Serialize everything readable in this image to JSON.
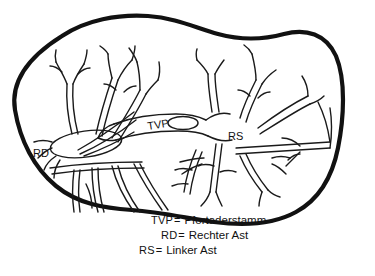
{
  "figure": {
    "type": "anatomical-diagram",
    "background_color": "#ffffff",
    "outline_color": "#111111",
    "vessel_color": "#1a1a1a"
  },
  "labels": {
    "trunk": "TVP",
    "right_branch": "RD",
    "left_branch": "RS"
  },
  "legend": {
    "rows": [
      {
        "abbr": "TVP",
        "eq": "=",
        "term": "Pfortaderstamm"
      },
      {
        "abbr": "RD",
        "eq": "=",
        "term": "Rechter Ast"
      },
      {
        "abbr": "RS",
        "eq": "=",
        "term": "Linker Ast"
      }
    ]
  }
}
